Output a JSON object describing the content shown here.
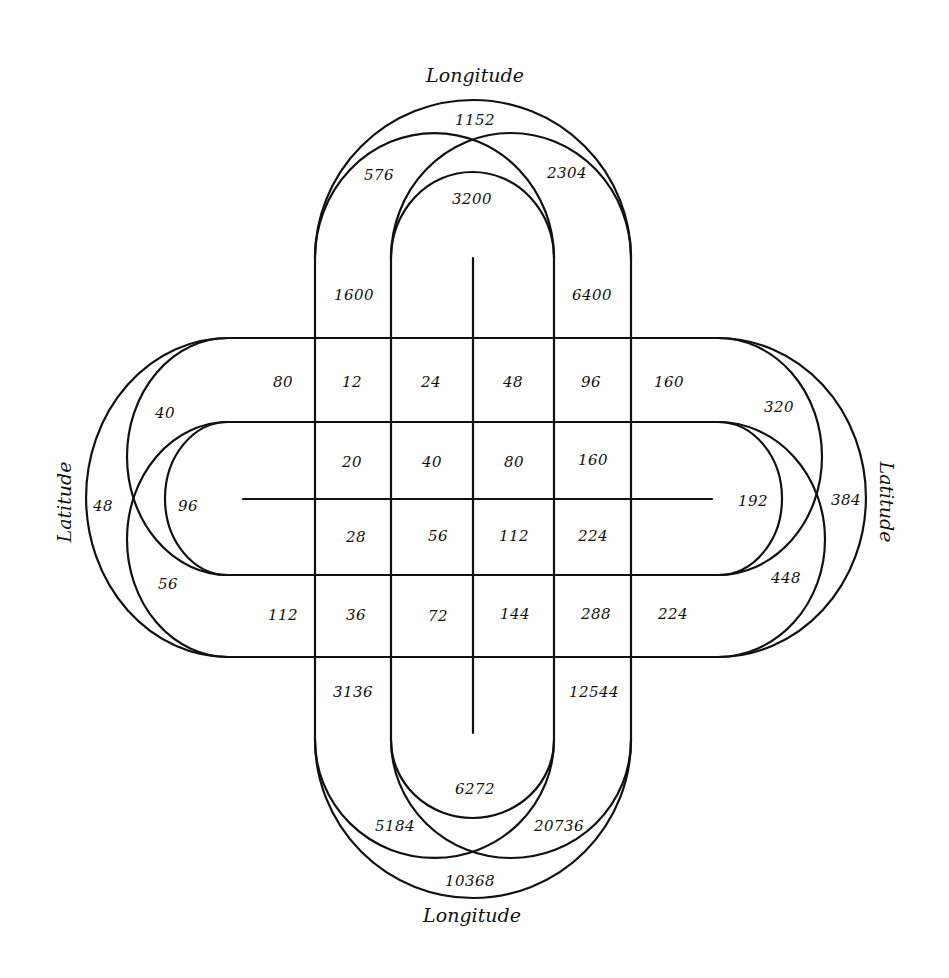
{
  "diagram": {
    "labels": {
      "top": "Longitude",
      "bottom": "Longitude",
      "left": "Latitude",
      "right": "Latitude"
    },
    "top_arcs": {
      "outer": "1152",
      "left": "576",
      "right": "2304",
      "inner": "3200"
    },
    "top_arms": {
      "left": "1600",
      "right": "6400"
    },
    "bottom_arms": {
      "left": "3136",
      "right": "12544"
    },
    "bottom_arcs": {
      "inner": "6272",
      "left": "5184",
      "right": "20736",
      "outer": "10368"
    },
    "left_arcs": {
      "upper": "40",
      "outer": "48",
      "inner": "96",
      "lower": "56"
    },
    "right_arcs": {
      "upper": "320",
      "outer": "384",
      "inner": "192",
      "lower": "448"
    },
    "grid": {
      "row1": [
        "80",
        "12",
        "24",
        "48",
        "96",
        "160"
      ],
      "row2": [
        "20",
        "40",
        "80",
        "160"
      ],
      "row3": [
        "28",
        "56",
        "112",
        "224"
      ],
      "row4": [
        "112",
        "36",
        "72",
        "144",
        "288",
        "224"
      ]
    }
  }
}
